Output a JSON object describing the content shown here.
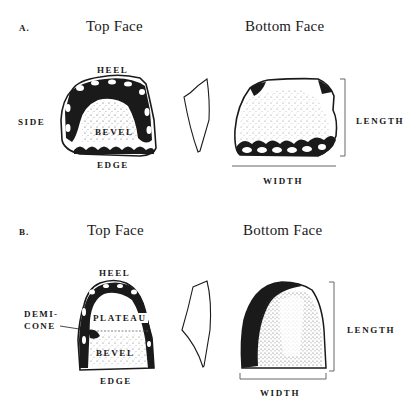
{
  "figure": {
    "panels": [
      {
        "id": "A",
        "letter": "A.",
        "top_face_title": "Top Face",
        "bottom_face_title": "Bottom Face",
        "top_labels": {
          "heel": "HEEL",
          "side": "SIDE",
          "bevel": "BEVEL",
          "edge": "EDGE"
        },
        "bottom_labels": {
          "length": "LENGTH",
          "width": "WIDTH"
        }
      },
      {
        "id": "B",
        "letter": "B.",
        "top_face_title": "Top Face",
        "bottom_face_title": "Bottom Face",
        "top_labels": {
          "heel": "HEEL",
          "demicone_line1": "DEMI-",
          "demicone_line2": "CONE",
          "plateau": "PLATEAU",
          "bevel": "BEVEL",
          "edge": "EDGE"
        },
        "bottom_labels": {
          "length": "LENGTH",
          "width": "WIDTH"
        }
      }
    ],
    "colors": {
      "ink": "#1a1a1a",
      "background": "#ffffff",
      "stipple": "#555555"
    }
  }
}
